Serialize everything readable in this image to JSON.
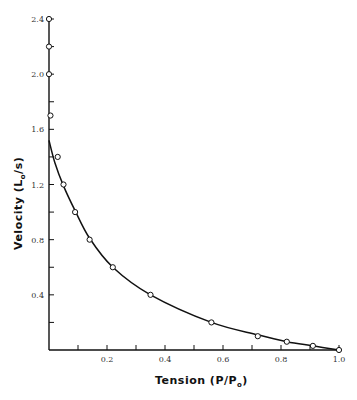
{
  "chart_data": {
    "type": "line",
    "title": "",
    "xlabel": "Tension (P/P₀)",
    "ylabel": "Velocity (L₀/s)",
    "xlabel_main": "Tension (P/P",
    "xlabel_sub": "o",
    "xlabel_end": ")",
    "ylabel_main": "Velocity (L",
    "ylabel_sub": "o",
    "ylabel_end": "/s)",
    "xlim": [
      0,
      1.0
    ],
    "ylim": [
      0,
      2.4
    ],
    "x_ticks": [
      0.1,
      0.2,
      0.3,
      0.4,
      0.5,
      0.6,
      0.7,
      0.8,
      0.9,
      1.0
    ],
    "x_tick_labels": [
      "0.2",
      "0.4",
      "0.6",
      "0.8",
      "1.0"
    ],
    "x_tick_label_values": [
      0.2,
      0.4,
      0.6,
      0.8,
      1.0
    ],
    "y_ticks": [
      0.2,
      0.4,
      0.6,
      0.8,
      1.0,
      1.2,
      1.4,
      1.6,
      1.8,
      2.0,
      2.2,
      2.4
    ],
    "y_tick_labels": [
      "0.4",
      "0.8",
      "1.2",
      "1.6",
      "2.0",
      "2.4"
    ],
    "y_tick_label_values": [
      0.4,
      0.8,
      1.2,
      1.6,
      2.0,
      2.4
    ],
    "grid": false,
    "legend": null,
    "series": [
      {
        "name": "measured",
        "marker": "open-circle",
        "x": [
          0.0,
          0.0,
          0.0,
          0.005,
          0.03,
          0.05,
          0.09,
          0.14,
          0.22,
          0.35,
          0.56,
          0.72,
          0.82,
          0.91,
          1.0
        ],
        "y": [
          2.4,
          2.2,
          2.0,
          1.7,
          1.4,
          1.2,
          1.0,
          0.8,
          0.6,
          0.4,
          0.2,
          0.1,
          0.06,
          0.03,
          0.0
        ]
      },
      {
        "name": "fitted curve",
        "marker": "none",
        "x": [
          0.0,
          0.02,
          0.05,
          0.09,
          0.14,
          0.22,
          0.35,
          0.56,
          0.72,
          0.82,
          0.91,
          1.0
        ],
        "y": [
          1.52,
          1.36,
          1.19,
          1.01,
          0.81,
          0.6,
          0.4,
          0.2,
          0.11,
          0.06,
          0.03,
          0.0
        ]
      }
    ]
  },
  "colors": {
    "line": "#111111",
    "marker_fill": "#ffffff",
    "marker_stroke": "#111111",
    "tick_text": "#333333"
  }
}
